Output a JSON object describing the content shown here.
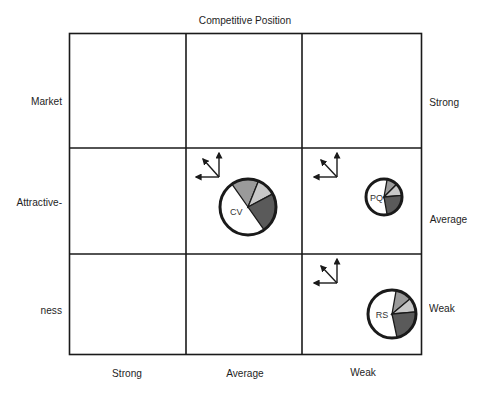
{
  "title": "Competitive Position",
  "y_axis": {
    "label_lines": [
      "Market",
      "Attractive-",
      "ness"
    ],
    "right_labels": [
      "Strong",
      "Average",
      "Weak"
    ]
  },
  "x_axis": {
    "labels": [
      "Strong",
      "Average",
      "Weak"
    ]
  },
  "grid": {
    "rows": 3,
    "cols": 3
  },
  "colors": {
    "line": "#1a1a1a",
    "medium_gray": "#9a9a9a",
    "light_gray": "#c8c8c8",
    "dark_gray": "#5a5a5a",
    "white": "#ffffff"
  },
  "items": [
    {
      "label": "CV",
      "row": "Average",
      "col": "Average",
      "size": "large",
      "segments": [
        {
          "name": "medium",
          "start": -125,
          "end": -68
        },
        {
          "name": "light",
          "start": -68,
          "end": -28
        },
        {
          "name": "dark",
          "start": -28,
          "end": 55
        }
      ]
    },
    {
      "label": "PQ",
      "row": "Average",
      "col": "Weak",
      "size": "small",
      "segments": [
        {
          "name": "medium",
          "start": -80,
          "end": -45
        },
        {
          "name": "light",
          "start": -45,
          "end": -5
        },
        {
          "name": "dark",
          "start": -5,
          "end": 80
        }
      ]
    },
    {
      "label": "RS",
      "row": "Weak",
      "col": "Weak",
      "size": "medium",
      "segments": [
        {
          "name": "medium",
          "start": -80,
          "end": -40
        },
        {
          "name": "light",
          "start": -40,
          "end": -5
        },
        {
          "name": "dark",
          "start": -5,
          "end": 78
        }
      ]
    }
  ]
}
